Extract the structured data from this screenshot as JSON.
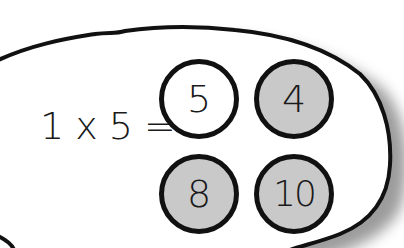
{
  "equation": {
    "operand_a": "1",
    "operator": "x",
    "operand_b": "5",
    "equals": "="
  },
  "choices": [
    {
      "label": "5",
      "fill": "#ffffff",
      "selected": true
    },
    {
      "label": "4",
      "fill": "#c9c9c9",
      "selected": false
    },
    {
      "label": "8",
      "fill": "#c9c9c9",
      "selected": false
    },
    {
      "label": "10",
      "fill": "#c9c9c9",
      "selected": false
    }
  ],
  "colors": {
    "outline": "#111111",
    "unselected_fill": "#c9c9c9",
    "selected_fill": "#ffffff",
    "shadow": "#8a8a8a"
  }
}
